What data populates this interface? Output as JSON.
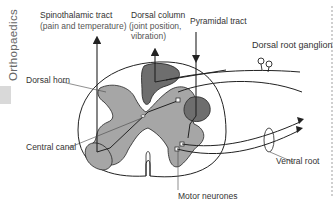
{
  "side_title": "Orthopaedics",
  "labels": {
    "spinothalamic_tract": "Spinothalamic tract",
    "spinothalamic_sub": "(pain and temperature)",
    "dorsal_column": "Dorsal column",
    "dorsal_column_sub1": "(joint position,",
    "dorsal_column_sub2": "vibration)",
    "pyramidal_tract": "Pyramidal tract",
    "dorsal_root_ganglion": "Dorsal root ganglion",
    "dorsal_horn": "Dorsal horn",
    "central_canal": "Central canal",
    "ventral_root": "Ventral root",
    "motor_neurones": "Motor neurones"
  },
  "colors": {
    "grey_matter": "#a6a6a6",
    "white_tract": "#6e6e6e",
    "outline": "#222222",
    "text": "#333333"
  }
}
